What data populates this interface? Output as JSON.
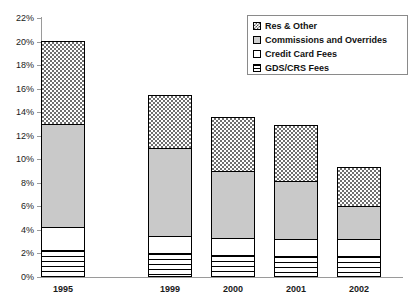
{
  "chart_data": {
    "type": "bar",
    "subtype": "stacked-bar",
    "title": "",
    "subtitle": "",
    "xlabel": "",
    "ylabel": "",
    "categories": [
      "1995",
      "1999",
      "2000",
      "2001",
      "2002"
    ],
    "ylim": [
      0,
      22
    ],
    "ytick_labels": [
      "0%",
      "2%",
      "4%",
      "6%",
      "8%",
      "10%",
      "12%",
      "14%",
      "16%",
      "18%",
      "20%",
      "22%"
    ],
    "ytick_values": [
      0,
      2,
      4,
      6,
      8,
      10,
      12,
      14,
      16,
      18,
      20,
      22
    ],
    "yunit": "%",
    "grid": false,
    "legend_position": "top-right",
    "stack_order_bottom_to_top": [
      "GDS/CRS Fees",
      "Credit Card Fees",
      "Commissions and Overrides",
      "Res & Other"
    ],
    "series": [
      {
        "name": "GDS/CRS Fees",
        "values": [
          2.3,
          2.0,
          1.9,
          1.8,
          1.8
        ]
      },
      {
        "name": "Credit Card Fees",
        "values": [
          2.0,
          1.5,
          1.5,
          1.5,
          1.5
        ]
      },
      {
        "name": "Commissions and Overrides",
        "values": [
          8.8,
          7.6,
          5.8,
          5.0,
          2.9
        ]
      },
      {
        "name": "Res & Other",
        "values": [
          7.1,
          4.6,
          4.7,
          4.8,
          3.4
        ]
      }
    ],
    "totals": [
      20.2,
      15.7,
      13.9,
      13.1,
      9.6
    ]
  },
  "legend": {
    "items": [
      {
        "label": "Res & Other",
        "swatch": "diagonal-crosshatch-swatch"
      },
      {
        "label": "Commissions and Overrides",
        "swatch": "solid-gray-swatch"
      },
      {
        "label": "Credit Card Fees",
        "swatch": "white-swatch"
      },
      {
        "label": "GDS/CRS Fees",
        "swatch": "horizontal-lines-swatch"
      }
    ]
  },
  "colors": {
    "axis": "#9a9a9a",
    "text": "#1a1a1a",
    "commissions_fill": "#c9c9c9",
    "credit_card_fill": "#ffffff",
    "res_other_hatch": "#6f6f6f",
    "gds_lines": "#000000",
    "plot_background": "#ffffff"
  }
}
